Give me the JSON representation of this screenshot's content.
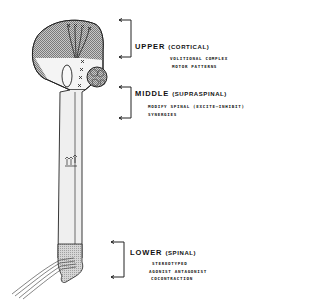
{
  "diagram": {
    "type": "neuraxis-motor-control-levels",
    "levels": [
      {
        "id": "upper",
        "name": "UPPER",
        "qualifier": "(CORTICAL)",
        "description": [
          "VOLITIONAL COMPLEX",
          "MOTOR PATTERNS"
        ]
      },
      {
        "id": "middle",
        "name": "MIDDLE",
        "qualifier": "(SUPRASPINAL)",
        "description": [
          "MODIFY SPINAL (EXCITE–INHIBIT)",
          "SYNERGIES"
        ]
      },
      {
        "id": "lower",
        "name": "LOWER",
        "qualifier": "(SPINAL)",
        "description": [
          "STEREOTYPED",
          "AGONIST ANTAGONIST",
          "COCONTRACTION"
        ]
      }
    ],
    "markers": {
      "cortex_synapse_symbol": "X",
      "cortex_synapse_count": 4,
      "brainstem_synapse_count": 4
    },
    "colors": {
      "stroke": "#222222",
      "fill_light": "#f2f2f2",
      "shade_dark": "#8c8c8c",
      "shade_mid": "#b5b5b5"
    }
  }
}
